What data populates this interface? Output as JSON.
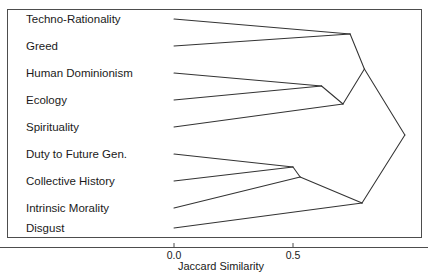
{
  "chart_data": {
    "type": "line",
    "chart_subtype": "dendrogram",
    "title": "",
    "xlabel": "Jaccard Similarity",
    "ylabel": "",
    "xticks": [
      "0.0",
      "0.5"
    ],
    "xtick_values": [
      0.0,
      0.5
    ],
    "xlim": [
      0.0,
      1.04
    ],
    "grid": false,
    "legend": null,
    "orientation": "horizontal-left-to-right",
    "leaf_labels": [
      "Techno-Rationality",
      "Greed",
      "Human Dominionism",
      "Ecology",
      "Spirituality",
      "Duty to Future Gen.",
      "Collective History",
      "Intrinsic Morality",
      "Disgust"
    ],
    "leaf_positions": [
      {
        "label": "Techno-Rationality",
        "y": 19,
        "x": 0.0
      },
      {
        "label": "Greed",
        "y": 46,
        "x": 0.0
      },
      {
        "label": "Human Dominionism",
        "y": 73,
        "x": 0.0
      },
      {
        "label": "Ecology",
        "y": 100,
        "x": 0.0
      },
      {
        "label": "Spirituality",
        "y": 127,
        "x": 0.0
      },
      {
        "label": "Duty to Future Gen.",
        "y": 154,
        "x": 0.0
      },
      {
        "label": "Collective History",
        "y": 181,
        "x": 0.0
      },
      {
        "label": "Intrinsic Morality",
        "y": 208,
        "x": 0.0
      },
      {
        "label": "Disgust",
        "y": 228,
        "x": 0.0
      }
    ],
    "merges": [
      {
        "id": "m1",
        "children": [
          "Techno-Rationality",
          "Greed"
        ],
        "similarity": 0.74,
        "y": 34
      },
      {
        "id": "m2",
        "children": [
          "Human Dominionism",
          "Ecology"
        ],
        "similarity": 0.62,
        "y": 86
      },
      {
        "id": "m3",
        "children": [
          "m2",
          "Spirituality"
        ],
        "similarity": 0.71,
        "y": 104
      },
      {
        "id": "m4",
        "children": [
          "m1",
          "m3"
        ],
        "similarity": 0.8,
        "y": 69
      },
      {
        "id": "m5",
        "children": [
          "Duty to Future Gen.",
          "Collective History"
        ],
        "similarity": 0.5,
        "y": 167
      },
      {
        "id": "m6",
        "children": [
          "m5",
          "Intrinsic Morality"
        ],
        "similarity": 0.53,
        "y": 177
      },
      {
        "id": "m7",
        "children": [
          "m6",
          "Disgust"
        ],
        "similarity": 0.79,
        "y": 203
      },
      {
        "id": "m8",
        "children": [
          "m4",
          "m7"
        ],
        "similarity": 0.97,
        "y": 135
      }
    ],
    "segments": [
      {
        "name": "techno-rationality-to-m1",
        "points": [
          [
            0.0,
            19
          ],
          [
            0.74,
            34
          ]
        ]
      },
      {
        "name": "greed-to-m1",
        "points": [
          [
            0.0,
            46
          ],
          [
            0.74,
            34
          ]
        ]
      },
      {
        "name": "human-dominionism-to-m2",
        "points": [
          [
            0.0,
            73
          ],
          [
            0.62,
            86
          ]
        ]
      },
      {
        "name": "ecology-to-m2",
        "points": [
          [
            0.0,
            100
          ],
          [
            0.62,
            86
          ]
        ]
      },
      {
        "name": "m2-to-m3",
        "points": [
          [
            0.62,
            86
          ],
          [
            0.71,
            104
          ]
        ]
      },
      {
        "name": "spirituality-to-m3",
        "points": [
          [
            0.0,
            127
          ],
          [
            0.71,
            104
          ]
        ]
      },
      {
        "name": "m1-to-m4",
        "points": [
          [
            0.74,
            34
          ],
          [
            0.8,
            69
          ]
        ]
      },
      {
        "name": "m3-to-m4",
        "points": [
          [
            0.71,
            104
          ],
          [
            0.8,
            69
          ]
        ]
      },
      {
        "name": "duty-to-m5",
        "points": [
          [
            0.0,
            154
          ],
          [
            0.5,
            167
          ]
        ]
      },
      {
        "name": "collective-history-to-m5",
        "points": [
          [
            0.0,
            181
          ],
          [
            0.5,
            167
          ]
        ]
      },
      {
        "name": "m5-to-m6",
        "points": [
          [
            0.5,
            167
          ],
          [
            0.53,
            177
          ]
        ]
      },
      {
        "name": "intrinsic-morality-to-m6",
        "points": [
          [
            0.0,
            208
          ],
          [
            0.53,
            177
          ]
        ]
      },
      {
        "name": "m6-to-m7",
        "points": [
          [
            0.53,
            177
          ],
          [
            0.79,
            203
          ]
        ]
      },
      {
        "name": "disgust-to-m7",
        "points": [
          [
            0.0,
            228
          ],
          [
            0.79,
            203
          ]
        ]
      },
      {
        "name": "m4-to-root",
        "points": [
          [
            0.8,
            69
          ],
          [
            0.97,
            135
          ]
        ]
      },
      {
        "name": "m7-to-root",
        "points": [
          [
            0.79,
            203
          ],
          [
            0.97,
            135
          ]
        ]
      }
    ],
    "colors": {
      "line": "#333333",
      "frame": "#4d4d4d",
      "text": "#1a1a1a",
      "background": "#ffffff"
    }
  }
}
